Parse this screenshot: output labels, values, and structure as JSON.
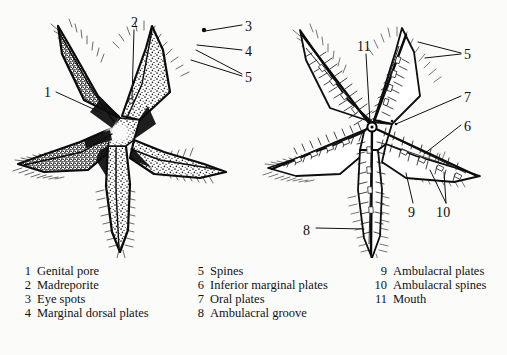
{
  "figure": {
    "views": [
      {
        "id": "aboral",
        "name": "Aboral (dorsal) view",
        "side": "left"
      },
      {
        "id": "oral",
        "name": "Oral (ventral) view",
        "side": "right"
      }
    ],
    "ink_color": "#111111",
    "background_color": "#fbfbfa"
  },
  "callouts": [
    {
      "num": "1",
      "x": 44,
      "y": 86,
      "view": "aboral"
    },
    {
      "num": "2",
      "x": 131,
      "y": 16,
      "view": "aboral"
    },
    {
      "num": "3",
      "x": 245,
      "y": 20,
      "view": "aboral"
    },
    {
      "num": "4",
      "x": 245,
      "y": 45,
      "view": "aboral"
    },
    {
      "num": "5",
      "x": 245,
      "y": 71,
      "view": "aboral"
    },
    {
      "num": "11",
      "x": 358,
      "y": 40,
      "view": "oral"
    },
    {
      "num": "5",
      "x": 464,
      "y": 48,
      "view": "oral"
    },
    {
      "num": "7",
      "x": 464,
      "y": 91,
      "view": "oral"
    },
    {
      "num": "6",
      "x": 464,
      "y": 120,
      "view": "oral"
    },
    {
      "num": "9",
      "x": 408,
      "y": 206,
      "view": "oral"
    },
    {
      "num": "10",
      "x": 439,
      "y": 206,
      "view": "oral"
    },
    {
      "num": "8",
      "x": 304,
      "y": 224,
      "view": "oral"
    }
  ],
  "legend": {
    "columns": [
      {
        "items": [
          {
            "num": "1",
            "label": "Genital pore"
          },
          {
            "num": "2",
            "label": "Madreporite"
          },
          {
            "num": "3",
            "label": "Eye spots"
          },
          {
            "num": "4",
            "label": "Marginal dorsal plates"
          }
        ]
      },
      {
        "items": [
          {
            "num": "5",
            "label": "Spines"
          },
          {
            "num": "6",
            "label": "Inferior marginal plates"
          },
          {
            "num": "7",
            "label": "Oral plates"
          },
          {
            "num": "8",
            "label": "Ambulacral groove"
          }
        ]
      },
      {
        "items": [
          {
            "num": "9",
            "label": "Ambulacral plates"
          },
          {
            "num": "10",
            "label": "Ambulacral spines"
          },
          {
            "num": "11",
            "label": "Mouth"
          }
        ]
      }
    ]
  }
}
